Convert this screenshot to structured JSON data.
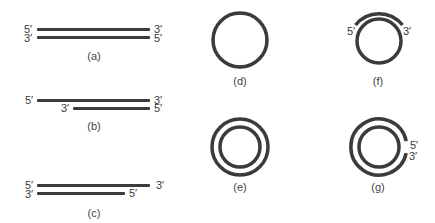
{
  "figure": {
    "panels": [
      {
        "id": "a",
        "caption": "(a)",
        "type": "linear-duplex",
        "description": "blunt-ended double strand",
        "labels": {
          "top_left": "5′",
          "bottom_left": "3′",
          "top_right": "3′",
          "bottom_right": "5′"
        }
      },
      {
        "id": "b",
        "caption": "(b)",
        "type": "linear-duplex",
        "description": "5′ strand overhang on left (bottom strand shorter)",
        "labels": {
          "top_left": "5′",
          "bottom_left": "3′",
          "top_right": "3′",
          "bottom_right": "5′"
        }
      },
      {
        "id": "c",
        "caption": "(c)",
        "type": "linear-duplex",
        "description": "bottom strand shorter on right",
        "labels": {
          "top_left": "5′",
          "bottom_left": "3′",
          "top_right": "3′",
          "bottom_right": "5′"
        }
      },
      {
        "id": "d",
        "caption": "(d)",
        "type": "single-circle",
        "description": "single-stranded circle"
      },
      {
        "id": "e",
        "caption": "(e)",
        "type": "double-circle",
        "description": "closed double-stranded circle"
      },
      {
        "id": "f",
        "caption": "(f)",
        "type": "circle-with-arc",
        "description": "circle with annealed partial arc",
        "labels": {
          "left": "5′",
          "right": "3′"
        }
      },
      {
        "id": "g",
        "caption": "(g)",
        "type": "nicked-double-circle",
        "description": "double circle with nick in outer strand",
        "labels": {
          "top": "5′",
          "bottom": "3′"
        }
      }
    ],
    "colors": {
      "strand": "#3b3b3b",
      "text": "#3a3a3a",
      "background": "#ffffff"
    }
  }
}
